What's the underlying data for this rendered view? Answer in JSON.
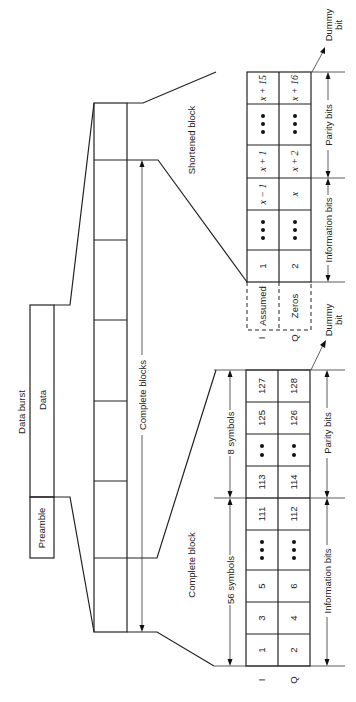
{
  "diagram": {
    "orientation": "rotated-90-ccw",
    "data_burst": {
      "title": "Data burst",
      "data_label": "Data",
      "preamble_label": "Preamble"
    },
    "complete_blocks_label": "Complete blocks",
    "complete_block": {
      "title": "Complete block",
      "info_symbols_label": "56 symbols",
      "parity_symbols_label": "8 symbols",
      "info_bits_label": "Information bits",
      "parity_bits_label": "Parity bits",
      "row_labels": [
        "I",
        "Q"
      ],
      "i_cells": [
        "1",
        "3",
        "5",
        "•••",
        "111",
        "113",
        "••",
        "125",
        "127"
      ],
      "q_cells": [
        "2",
        "4",
        "6",
        "•••",
        "112",
        "114",
        "••",
        "126",
        "128"
      ],
      "dummy_bit_label": [
        "Dummy",
        "bit"
      ]
    },
    "shortened_block": {
      "title": "Shortened block",
      "info_bits_label": "Information bits",
      "parity_bits_label": "Parity bits",
      "row_labels": [
        "I",
        "Q"
      ],
      "assumed_label": "Assumed",
      "zeros_label": "Zeros",
      "i_cells": [
        "1",
        "•••",
        "x − 1",
        "x + 1",
        "•••",
        "x + 15"
      ],
      "q_cells": [
        "2",
        "•••",
        "x",
        "x + 2",
        "•••",
        "x + 16"
      ],
      "dummy_bit_label_top": [
        "Dummy",
        "bit"
      ],
      "dummy_bit_label_bottom": [
        "Dummy",
        "bit"
      ]
    }
  }
}
